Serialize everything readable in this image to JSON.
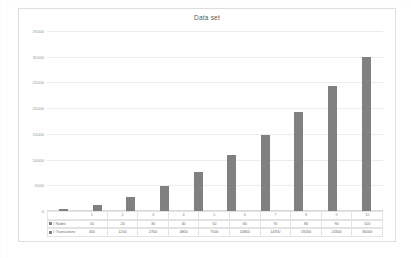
{
  "chart": {
    "title": "Data set",
    "bar_color": "#808080",
    "grid_color": "#ececec"
  },
  "axis": {
    "yticks": [
      "35000",
      "30000",
      "25000",
      "20000",
      "15000",
      "10000",
      "5000",
      "0"
    ],
    "ymax": 35000
  },
  "table": {
    "row_labels": [
      "# Nodes",
      "# Transactions"
    ],
    "categories": [
      "1",
      "2",
      "3",
      "4",
      "5",
      "6",
      "7",
      "8",
      "9",
      "10"
    ],
    "nodes": [
      "10",
      "20",
      "30",
      "40",
      "50",
      "60",
      "70",
      "80",
      "90",
      "100"
    ],
    "transactions": [
      "300",
      "1200",
      "2700",
      "4800",
      "7500",
      "10800",
      "14700",
      "19200",
      "24300",
      "30000"
    ]
  },
  "chart_data": {
    "type": "bar",
    "title": "Data set",
    "xlabel": "",
    "ylabel": "",
    "ylim": [
      0,
      35000
    ],
    "grid": true,
    "legend": [
      "# Nodes",
      "# Transactions"
    ],
    "legend_position": "bottom-table",
    "categories": [
      "1",
      "2",
      "3",
      "4",
      "5",
      "6",
      "7",
      "8",
      "9",
      "10"
    ],
    "series": [
      {
        "name": "# Nodes",
        "values": [
          10,
          20,
          30,
          40,
          50,
          60,
          70,
          80,
          90,
          100
        ],
        "plotted": false
      },
      {
        "name": "# Transactions",
        "values": [
          300,
          1200,
          2700,
          4800,
          7500,
          10800,
          14700,
          19200,
          24300,
          30000
        ],
        "plotted": true
      }
    ],
    "yticks": [
      0,
      5000,
      10000,
      15000,
      20000,
      25000,
      30000,
      35000
    ]
  }
}
